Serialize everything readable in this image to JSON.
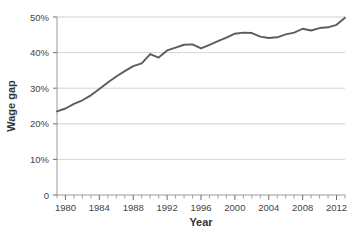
{
  "chart_data": {
    "type": "line",
    "title": "",
    "subtitle": "",
    "xlabel": "Year",
    "ylabel": "Wage gap",
    "xlim": [
      1979,
      2013
    ],
    "ylim": [
      0,
      50
    ],
    "grid": true,
    "legend": false,
    "legend_position": "none",
    "line_color": "#5c5c5c",
    "grid_color": "#c8c8c8",
    "axis_color": "#9a9a9a",
    "y_ticks": [
      0,
      10,
      20,
      30,
      40,
      50
    ],
    "y_tick_labels": [
      "0",
      "10%",
      "20%",
      "30%",
      "40%",
      "50%"
    ],
    "x_major_ticks": [
      1980,
      1984,
      1988,
      1992,
      1996,
      2000,
      2004,
      2008,
      2012
    ],
    "x_major_tick_labels": [
      "1980",
      "1984",
      "1988",
      "1992",
      "1996",
      "2000",
      "2004",
      "2008",
      "2012"
    ],
    "x_minor_tick_interval": 1,
    "series": [
      {
        "name": "Wage gap",
        "x": [
          1979,
          1980,
          1981,
          1982,
          1983,
          1984,
          1985,
          1986,
          1987,
          1988,
          1989,
          1990,
          1991,
          1992,
          1993,
          1994,
          1995,
          1996,
          1997,
          1998,
          1999,
          2000,
          2001,
          2002,
          2003,
          2004,
          2005,
          2006,
          2007,
          2008,
          2009,
          2010,
          2011,
          2012,
          2013
        ],
        "values": [
          23.5,
          24.3,
          25.6,
          26.6,
          28.0,
          29.8,
          31.6,
          33.3,
          34.8,
          36.2,
          37.0,
          39.6,
          38.6,
          40.6,
          41.4,
          42.2,
          42.3,
          41.2,
          42.2,
          43.2,
          44.2,
          45.3,
          45.6,
          45.5,
          44.5,
          44.1,
          44.3,
          45.1,
          45.6,
          46.7,
          46.2,
          46.9,
          47.1,
          47.8,
          49.8
        ]
      }
    ]
  },
  "axes": {
    "y_axis_title": "Wage gap",
    "x_axis_title": "Year"
  }
}
